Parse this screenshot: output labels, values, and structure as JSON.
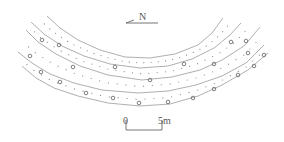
{
  "figure": {
    "type": "plan-view archaeological diagram",
    "band_count": 4,
    "outline_count": 5
  },
  "north_arrow": {
    "label": "N",
    "direction": "left"
  },
  "scale_bar": {
    "start_label": "0",
    "end_label": "5m",
    "length_m": 5
  },
  "colors": {
    "line": "#9a9a9a",
    "marks": "#707070",
    "text": "#555555",
    "background": "#ffffff"
  }
}
